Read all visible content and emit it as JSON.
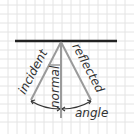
{
  "diagram": {
    "labels": {
      "incident": "incident",
      "normal": "normal",
      "reflected": "reflected",
      "angle": "angle"
    },
    "colors": {
      "background": "#ffffff",
      "grid": "#e4e4e4",
      "mirror": "#222222",
      "rays": "#9a9a9a",
      "arrows": "#333333",
      "text": "#333333"
    }
  }
}
